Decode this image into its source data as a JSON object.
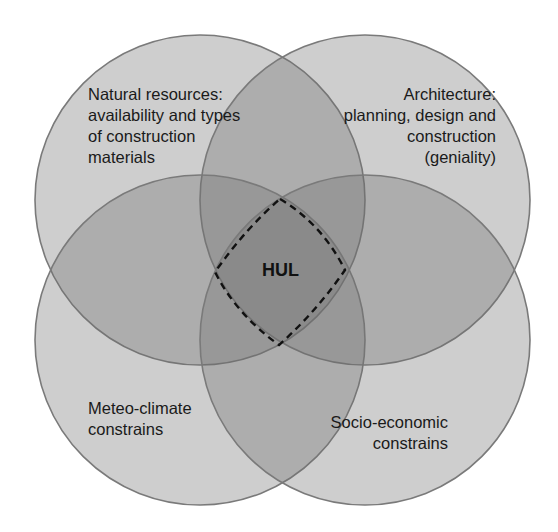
{
  "diagram": {
    "type": "venn",
    "circles": [
      {
        "id": "natural-resources",
        "label": "Natural resources:\navailability and types\nof construction\nmaterials",
        "cx": 200,
        "cy": 200,
        "r": 165
      },
      {
        "id": "architecture",
        "label": "Architecture:\nplanning, design and\nconstruction\n(geniality)",
        "cx": 365,
        "cy": 200,
        "r": 165
      },
      {
        "id": "meteo-climate",
        "label": "Meteo-climate\nconstrains",
        "cx": 200,
        "cy": 340,
        "r": 165
      },
      {
        "id": "socio-economic",
        "label": "Socio-economic\nconstrains",
        "cx": 365,
        "cy": 340,
        "r": 165
      }
    ],
    "center": {
      "label": "HUL",
      "boundary": "dashed"
    },
    "colors": {
      "background": "#ffffff",
      "single_region": "#c8c8c8",
      "double_overlap": "#a9a9a9",
      "center_overlap": "#8f8f8f",
      "circle_stroke": "#7a7a7a",
      "text": "#1a1a1a"
    }
  }
}
